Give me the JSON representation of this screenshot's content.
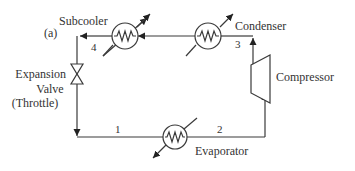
{
  "diagram": {
    "panel_label": "(a)",
    "components": {
      "subcooler": "Subcooler",
      "condenser": "Condenser",
      "compressor": "Compressor",
      "evaporator": "Evaporator",
      "valve_line1": "Expansion",
      "valve_line2": "Valve",
      "valve_line3": "(Throttle)"
    },
    "states": {
      "s1": "1",
      "s2": "2",
      "s3": "3",
      "s4": "4"
    },
    "colors": {
      "line": "#3a3a3a",
      "text": "#333333",
      "background": "#ffffff"
    }
  }
}
